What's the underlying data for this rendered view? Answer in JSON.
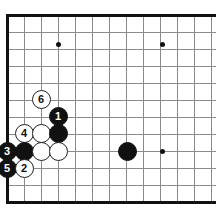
{
  "diagram": {
    "type": "go-board-diagram",
    "board": {
      "origin_x": 7,
      "origin_y": 15,
      "cell": 17,
      "cols": 13,
      "rows": 12,
      "line_color": "#8a8a8a",
      "edge_color": "#111111",
      "background": "#ffffff",
      "edges": [
        "left",
        "top",
        "bottom"
      ]
    },
    "star_points": [
      {
        "name": "star-point-top-left",
        "x": 58,
        "y": 44
      },
      {
        "name": "star-point-top-right",
        "x": 162,
        "y": 44
      },
      {
        "name": "star-point-bottom-right",
        "x": 162,
        "y": 151
      }
    ],
    "stones": [
      {
        "name": "stone-white-6",
        "color": "white",
        "label": "6",
        "x": 41,
        "y": 99
      },
      {
        "name": "stone-black-1",
        "color": "black",
        "label": "1",
        "x": 58,
        "y": 116
      },
      {
        "name": "stone-white-4",
        "color": "white",
        "label": "4",
        "x": 24,
        "y": 133
      },
      {
        "name": "stone-white-plain-a",
        "color": "white",
        "label": "",
        "x": 41,
        "y": 133
      },
      {
        "name": "stone-black-plain-a",
        "color": "black",
        "label": "",
        "x": 58,
        "y": 133
      },
      {
        "name": "stone-black-3",
        "color": "black",
        "label": "3",
        "x": 7,
        "y": 151
      },
      {
        "name": "stone-black-plain-b",
        "color": "black",
        "label": "",
        "x": 24,
        "y": 151
      },
      {
        "name": "stone-white-plain-b",
        "color": "white",
        "label": "",
        "x": 41,
        "y": 151
      },
      {
        "name": "stone-white-plain-c",
        "color": "white",
        "label": "",
        "x": 58,
        "y": 151
      },
      {
        "name": "stone-black-plain-c",
        "color": "black",
        "label": "",
        "x": 127,
        "y": 151
      },
      {
        "name": "stone-black-5",
        "color": "black",
        "label": "5",
        "x": 7,
        "y": 168
      },
      {
        "name": "stone-white-2",
        "color": "white",
        "label": "2",
        "x": 24,
        "y": 168
      }
    ]
  }
}
